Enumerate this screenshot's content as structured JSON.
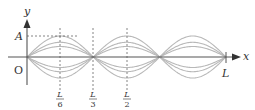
{
  "diagram": {
    "type": "standing-wave",
    "axes": {
      "x_label": "x",
      "y_label": "y",
      "origin_label": "O"
    },
    "amplitude_label": "A",
    "length_label": "L",
    "markers": [
      {
        "num": "L",
        "den": "6"
      },
      {
        "num": "L",
        "den": "3"
      },
      {
        "num": "L",
        "den": "2"
      }
    ],
    "loops": 3,
    "envelope_fractions": [
      1.0,
      0.7,
      0.5
    ],
    "colors": {
      "axis": "#555555",
      "wave": "#b8b8b8",
      "dash": "#666666",
      "text": "#333333"
    }
  }
}
